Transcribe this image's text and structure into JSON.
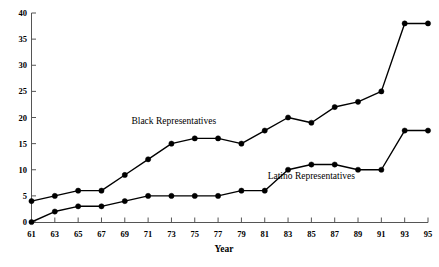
{
  "chart_data": {
    "type": "line",
    "title": "",
    "xlabel": "Year",
    "ylabel": "",
    "xlim": [
      61,
      95
    ],
    "ylim": [
      0,
      40
    ],
    "grid": false,
    "legend_position": "inline-annotation",
    "x": [
      61,
      63,
      65,
      67,
      69,
      71,
      73,
      75,
      77,
      79,
      81,
      83,
      85,
      87,
      89,
      91,
      93,
      95
    ],
    "xtick_labels": [
      "61",
      "63",
      "65",
      "67",
      "69",
      "71",
      "73",
      "75",
      "77",
      "79",
      "81",
      "83",
      "85",
      "87",
      "89",
      "91",
      "93",
      "95"
    ],
    "ytick_labels": [
      "0",
      "5",
      "10",
      "15",
      "20",
      "25",
      "30",
      "35",
      "40"
    ],
    "yticks": [
      0,
      5,
      10,
      15,
      20,
      25,
      30,
      35,
      40
    ],
    "series": [
      {
        "name": "Black Representatives",
        "label": "Black Representatives",
        "color": "#000000",
        "marker": "circle",
        "values": [
          4,
          5,
          6,
          6,
          9,
          12,
          15,
          16,
          16,
          15,
          17.5,
          20,
          19,
          22,
          23,
          25,
          38,
          38
        ]
      },
      {
        "name": "Latino Representatives",
        "label": "Latino Representatives",
        "color": "#000000",
        "marker": "circle",
        "values": [
          0,
          2,
          3,
          3,
          4,
          5,
          5,
          5,
          5,
          6,
          6,
          10,
          11,
          11,
          10,
          10,
          17.5,
          17.5
        ]
      }
    ],
    "annotations": [
      {
        "text": "Black Representatives",
        "x": 73.2,
        "y": 18.8
      },
      {
        "text": "Latino Representatives",
        "x": 85.0,
        "y": 8.2
      }
    ]
  }
}
